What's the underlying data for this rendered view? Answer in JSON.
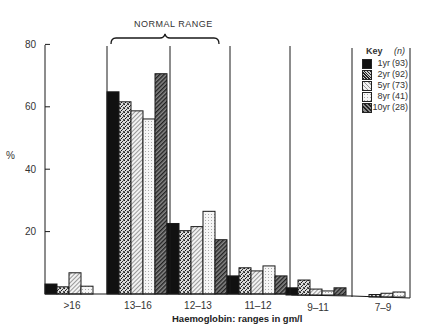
{
  "chart_data": {
    "type": "bar",
    "title": "",
    "annotation": "NORMAL RANGE",
    "xlabel": "Haemoglobin: ranges in gm/l",
    "ylabel": "%",
    "ylim": [
      0,
      80
    ],
    "yticks": [
      20,
      40,
      60,
      80
    ],
    "grid": false,
    "legend_position": "upper right",
    "legend_title": "Key",
    "legend_n_header": "(n)",
    "categories": [
      ">16",
      "13–16",
      "12–13",
      "11–12",
      "9–11",
      "7–9"
    ],
    "series": [
      {
        "name": "1yr",
        "n": "(93)",
        "values": [
          3.2,
          64.8,
          22.6,
          5.8,
          2.3,
          0
        ]
      },
      {
        "name": "2yr",
        "n": "(92)",
        "values": [
          2.3,
          61.6,
          20.3,
          8.4,
          4.8,
          0.8
        ]
      },
      {
        "name": "5yr",
        "n": "(73)",
        "values": [
          6.8,
          58.7,
          21.6,
          7.4,
          1.9,
          1.2
        ]
      },
      {
        "name": "8yr",
        "n": "(41)",
        "values": [
          2.5,
          56.1,
          26.5,
          9.0,
          1.3,
          1.6
        ]
      },
      {
        "name": "10yr",
        "n": "(28)",
        "values": [
          0,
          70.6,
          17.4,
          5.8,
          2.3,
          0
        ]
      }
    ]
  },
  "axis": {
    "ylabel": "%",
    "yticks": [
      "20",
      "40",
      "60",
      "80"
    ],
    "xticks": [
      ">16",
      "13–16",
      "12–13",
      "11–12",
      "9–11",
      "7–9"
    ],
    "xlabel": "Haemoglobin: ranges in gm/l"
  },
  "annotation": {
    "normal_range": "NORMAL RANGE"
  },
  "legend": {
    "title": "Key",
    "n_header": "(n)",
    "items": [
      {
        "label": "1yr",
        "n": "(93)"
      },
      {
        "label": "2yr",
        "n": "(92)"
      },
      {
        "label": "5yr",
        "n": "(73)"
      },
      {
        "label": "8yr",
        "n": "(41)"
      },
      {
        "label": "10yr",
        "n": "(28)"
      }
    ]
  },
  "colors": {
    "ink": "#1a1a1a",
    "paper": "#ffffff"
  }
}
